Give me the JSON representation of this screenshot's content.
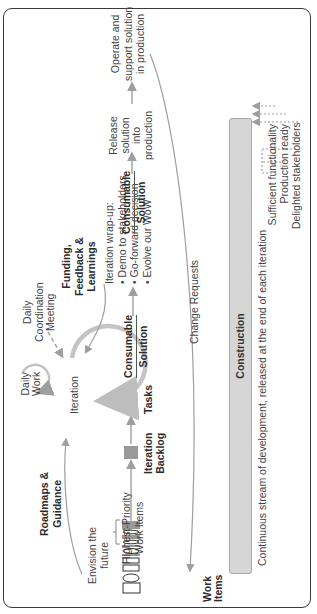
{
  "diagram": {
    "orientation": "rotated 90 degrees counter-clockwise",
    "work_items": {
      "label_line1": "Work",
      "label_line2": "Items"
    },
    "highest_priority": {
      "line1": "Highest-Priority",
      "line2": "Work Items"
    },
    "iteration_backlog": {
      "line1": "Iteration",
      "line2": "Backlog"
    },
    "tasks": {
      "label": "Tasks"
    },
    "iteration": {
      "label": "Iteration"
    },
    "daily_work": {
      "line1": "Daily",
      "line2": "Work"
    },
    "daily_coordination": {
      "line1": "Daily",
      "line2": "Coordination",
      "line3": "Meeting"
    },
    "roadmaps": {
      "line1": "Roadmaps &",
      "line2": "Guidance"
    },
    "envision": {
      "line1": "Envision the",
      "line2": "future"
    },
    "consumable_left": {
      "line1": "Consumable",
      "line2": "Solution"
    },
    "funding": {
      "line1": "Funding,",
      "line2": "Feedback &",
      "line3": "Learnings"
    },
    "wrapup": {
      "title": "Iteration wrap-up:",
      "items": [
        "• Demo to stakeholders",
        "• Go-forward decision",
        "• Evolve our WoW"
      ]
    },
    "consumable_right": {
      "line1": "Consumable",
      "line2": "Solution"
    },
    "release": {
      "line1": "Release",
      "line2": "solution",
      "line3": "into",
      "line4": "production"
    },
    "operate": {
      "line1": "Operate and",
      "line2": "support solution",
      "line3": "in production"
    },
    "change_requests": {
      "label": "Change Requests"
    },
    "construction": {
      "bar_label": "Construction",
      "caption": "Continuous stream of development, released at the end of each iteration"
    },
    "criteria": [
      "Sufficient functionality",
      "Production ready",
      "Delighted stakeholders"
    ],
    "colors": {
      "arrow": "#9e9e9e",
      "bar_fill": "#d6d6d6",
      "frame": "#3a3a3a",
      "text": "#444444"
    }
  }
}
